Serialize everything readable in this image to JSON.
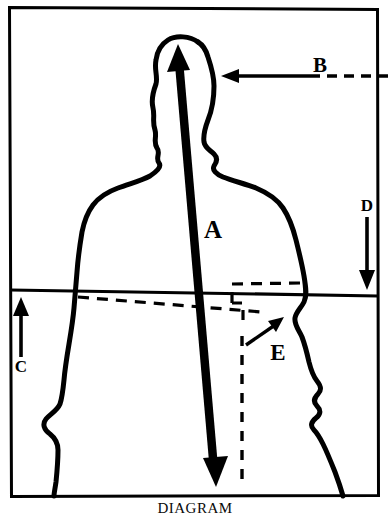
{
  "figure": {
    "caption": "DIAGRAM",
    "frame_color": "#000000",
    "background_color": "#ffffff",
    "ink_color": "#000000"
  },
  "labels": {
    "a": "A",
    "b": "B",
    "c": "C",
    "d": "D",
    "e": "E"
  },
  "annotations": [
    {
      "id": "a",
      "label": "A",
      "marker": "double-headed-arrow",
      "style": "solid",
      "orientation": "vertical",
      "from": [
        178,
        47
      ],
      "to": [
        215,
        483
      ],
      "label_pos": [
        205,
        240
      ]
    },
    {
      "id": "b",
      "label": "B",
      "marker": "single-arrow-left",
      "style": "solid-then-dashed",
      "orientation": "horizontal",
      "from": [
        385,
        75
      ],
      "to": [
        222,
        75
      ],
      "label_pos": [
        312,
        72
      ]
    },
    {
      "id": "c",
      "label": "C",
      "marker": "single-arrow-up",
      "style": "solid",
      "orientation": "vertical",
      "from": [
        21,
        356
      ],
      "to": [
        21,
        298
      ],
      "label_pos": [
        21,
        369
      ]
    },
    {
      "id": "d",
      "label": "D",
      "marker": "single-arrow-down",
      "style": "solid",
      "orientation": "vertical",
      "from": [
        367,
        217
      ],
      "to": [
        367,
        289
      ],
      "label_pos": [
        367,
        212
      ]
    },
    {
      "id": "e",
      "label": "E",
      "marker": "single-arrow-up-right",
      "style": "solid",
      "orientation": "diagonal",
      "from": [
        246,
        344
      ],
      "to": [
        281,
        318
      ],
      "label_pos": [
        279,
        358
      ]
    }
  ],
  "guides": [
    {
      "id": "horizon-line",
      "style": "solid",
      "description": "waist level reference line spanning frame"
    },
    {
      "id": "slope-dashed-line",
      "style": "dashed",
      "description": "sloping dashed reference line below waist"
    },
    {
      "id": "dashed-step-box",
      "style": "dashed",
      "description": "dashed stepped outline at right hip"
    },
    {
      "id": "vertical-dashed-drop",
      "style": "dashed",
      "description": "vertical dashed drop line to base"
    }
  ],
  "colors": {
    "ink": "#000000",
    "paper": "#ffffff"
  }
}
